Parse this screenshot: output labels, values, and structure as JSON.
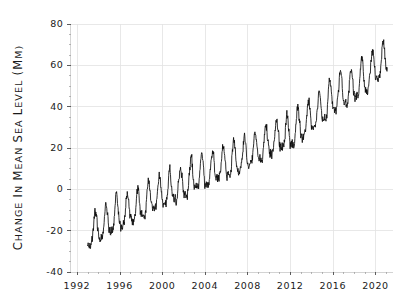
{
  "chart_data": {
    "type": "line",
    "title": "",
    "subtitle": "",
    "xlabel": "",
    "ylabel": "Change in Mean Sea Level (mm)",
    "ylabel_display": "CHANGE IN MEAN SEA LEVEL (MM)",
    "xlim": [
      1991.4,
      2021.6
    ],
    "ylim": [
      -40,
      80
    ],
    "grid": true,
    "legend": null,
    "legend_position": "none",
    "line_color": "#0b0b0b",
    "grid_color": "#e2e2e2",
    "background_color": "#ffffff",
    "xticks": [
      1992,
      1996,
      2000,
      2004,
      2008,
      2012,
      2016,
      2020
    ],
    "xtick_labels": [
      "1992",
      "1996",
      "2000",
      "2004",
      "2008",
      "2012",
      "2016",
      "2020"
    ],
    "xtick_minor_step": 1,
    "yticks": [
      -40,
      -20,
      0,
      20,
      40,
      60,
      80
    ],
    "ytick_labels": [
      "-40",
      "-20",
      "0",
      "20",
      "40",
      "60",
      "80"
    ],
    "ytick_minor_step": 5,
    "series": [
      {
        "name": "Change in Mean Sea Level",
        "units": "mm",
        "x_start": 1993.0,
        "x_end": 2021.1,
        "sampling_per_year": 36,
        "trend_mm_per_year": 3.35,
        "value_at_1993": -25.0,
        "value_at_2021": 72.0,
        "annual_cycle_amplitude_mm": 7.5,
        "noise_amplitude_mm": 3.2,
        "annual_peak_phase_fraction": 0.72,
        "annotations": [],
        "yearly_mean_values": [
          -22.0,
          -18.5,
          -15.5,
          -13.0,
          -10.2,
          -9.0,
          -5.5,
          -2.0,
          -1.0,
          2.0,
          5.5,
          7.0,
          9.5,
          12.5,
          14.0,
          16.5,
          19.5,
          22.0,
          25.0,
          26.0,
          31.0,
          34.5,
          38.0,
          43.0,
          46.5,
          49.0,
          53.5,
          58.0,
          62.0
        ],
        "yearly_years": [
          1993,
          1994,
          1995,
          1996,
          1997,
          1998,
          1999,
          2000,
          2001,
          2002,
          2003,
          2004,
          2005,
          2006,
          2007,
          2008,
          2009,
          2010,
          2011,
          2012,
          2013,
          2014,
          2015,
          2016,
          2017,
          2018,
          2019,
          2020,
          2021
        ]
      }
    ]
  }
}
